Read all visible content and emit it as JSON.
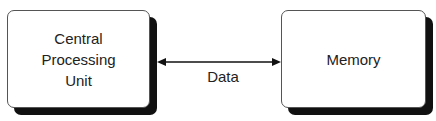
{
  "diagram": {
    "nodes": [
      {
        "id": "cpu",
        "label": "Central\nProcessing\nUnit"
      },
      {
        "id": "memory",
        "label": "Memory"
      }
    ],
    "edges": [
      {
        "from": "cpu",
        "to": "memory",
        "direction": "bidirectional",
        "label": "Data"
      }
    ]
  }
}
